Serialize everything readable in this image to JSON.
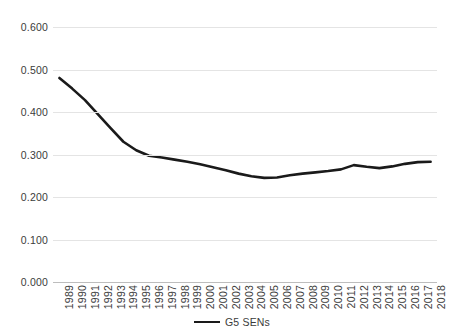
{
  "chart_data": {
    "type": "line",
    "title": "",
    "xlabel": "",
    "ylabel": "",
    "grid": true,
    "legend_position": "bottom",
    "ylim": [
      0.0,
      0.6
    ],
    "ytick_labels": [
      "0.600",
      "0.500",
      "0.400",
      "0.300",
      "0.200",
      "0.100",
      "0.000"
    ],
    "ytick_values": [
      0.6,
      0.5,
      0.4,
      0.3,
      0.2,
      0.1,
      0.0
    ],
    "categories": [
      "1989",
      "1990",
      "1991",
      "1992",
      "1993",
      "1994",
      "1995",
      "1996",
      "1997",
      "1998",
      "1999",
      "2000",
      "2001",
      "2002",
      "2003",
      "2004",
      "2005",
      "2006",
      "2007",
      "2008",
      "2009",
      "2010",
      "2011",
      "2012",
      "2013",
      "2014",
      "2015",
      "2016",
      "2017",
      "2018"
    ],
    "series": [
      {
        "name": "G5 SENs",
        "color": "#1a1a1a",
        "values": [
          0.48,
          0.455,
          0.428,
          0.395,
          0.362,
          0.33,
          0.31,
          0.297,
          0.293,
          0.288,
          0.283,
          0.277,
          0.27,
          0.263,
          0.255,
          0.249,
          0.245,
          0.246,
          0.251,
          0.255,
          0.258,
          0.261,
          0.265,
          0.275,
          0.271,
          0.268,
          0.272,
          0.278,
          0.282,
          0.283
        ]
      }
    ]
  },
  "legend": {
    "entries": [
      {
        "label": "G5 SENs",
        "marker": "line-marker"
      }
    ]
  }
}
